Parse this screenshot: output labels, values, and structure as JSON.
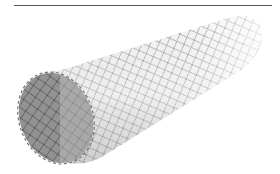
{
  "figure": {
    "colors": {
      "background": "#ffffff",
      "rule": "#555555",
      "lumen_dark": "#8a8a8a",
      "body_light": "#e2e2e2",
      "wire": "#6a6a6a"
    }
  }
}
